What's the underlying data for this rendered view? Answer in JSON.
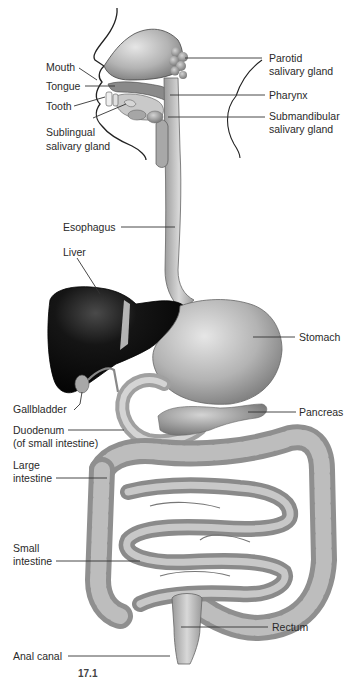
{
  "figure": {
    "figure_number_partial": "17.1",
    "colors": {
      "background": "#ffffff",
      "organ_gray": "#b8b8b8",
      "organ_dark": "#7a7a7a",
      "liver": "#141414",
      "label_text": "#2a2a2a",
      "leader_line": "#333333"
    }
  },
  "labels": {
    "mouth": "Mouth",
    "tongue": "Tongue",
    "tooth": "Tooth",
    "sublingual_1": "Sublingual",
    "sublingual_2": "salivary gland",
    "parotid_1": "Parotid",
    "parotid_2": "salivary gland",
    "pharynx": "Pharynx",
    "submandibular_1": "Submandibular",
    "submandibular_2": "salivary gland",
    "esophagus": "Esophagus",
    "liver": "Liver",
    "stomach": "Stomach",
    "gallbladder": "Gallbladder",
    "pancreas": "Pancreas",
    "duodenum_1": "Duodenum",
    "duodenum_2": "(of small intestine)",
    "large_intestine_1": "Large",
    "large_intestine_2": "intestine",
    "small_intestine_1": "Small",
    "small_intestine_2": "intestine",
    "rectum": "Rectum",
    "anal_canal": "Anal canal"
  }
}
